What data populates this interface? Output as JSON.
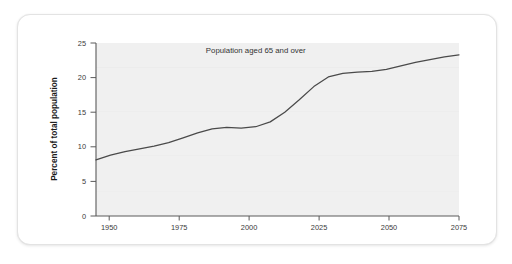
{
  "chart_data": {
    "type": "line",
    "title": "",
    "xlabel": "",
    "ylabel": "Percent of total population",
    "xlim": [
      1950,
      2075
    ],
    "ylim": [
      0,
      25
    ],
    "grid": false,
    "legend": "none",
    "annotations": [
      {
        "text": "Population aged 65 and over",
        "x": 2005,
        "y": 23.6
      }
    ],
    "xticks": [
      1950,
      1975,
      2000,
      2025,
      2050,
      2075
    ],
    "xtick_labels": [
      "1950",
      "1975",
      "2000",
      "2025",
      "2050",
      "2075"
    ],
    "yticks": [
      0,
      5,
      10,
      15,
      20,
      25
    ],
    "ytick_labels": [
      "0",
      "5",
      "10",
      "15",
      "20",
      "25"
    ],
    "series": [
      {
        "name": "Population aged 65 and over",
        "color": "#4a4a4a",
        "x": [
          1950,
          1955,
          1960,
          1965,
          1970,
          1975,
          1980,
          1985,
          1990,
          1995,
          2000,
          2005,
          2010,
          2015,
          2020,
          2025,
          2030,
          2035,
          2040,
          2045,
          2050,
          2055,
          2060,
          2065,
          2070,
          2075
        ],
        "values": [
          8.1,
          8.8,
          9.3,
          9.7,
          10.1,
          10.6,
          11.3,
          12.0,
          12.6,
          12.8,
          12.7,
          12.9,
          13.6,
          15.0,
          16.8,
          18.7,
          20.1,
          20.6,
          20.8,
          20.9,
          21.2,
          21.7,
          22.2,
          22.6,
          23.0,
          23.3
        ]
      }
    ],
    "colors": {
      "plot_background": "#f0f0f0",
      "axis": "#5a5a5a",
      "line": "#4a4a4a",
      "card_background": "#ffffff",
      "page_background": "#ffffff",
      "tick_label": "#3a3a3a",
      "axis_title": "#1a1a1a"
    }
  }
}
